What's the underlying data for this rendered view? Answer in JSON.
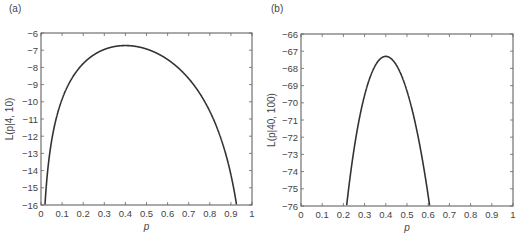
{
  "chart_data": [
    {
      "type": "line",
      "panel_label": "(a)",
      "title": "",
      "xlabel": "p",
      "ylabel": "L(p|4, 10)",
      "xlim": [
        0,
        1
      ],
      "ylim": [
        -16,
        -6
      ],
      "xticks": [
        "0",
        "0.1",
        "0.2",
        "0.3",
        "0.4",
        "0.5",
        "0.6",
        "0.7",
        "0.8",
        "0.9",
        "1"
      ],
      "yticks": [
        "-6",
        "-7",
        "-8",
        "-9",
        "-10",
        "-11",
        "-12",
        "-13",
        "-14",
        "-15",
        "-16"
      ],
      "grid": false,
      "function": "k*ln(p) + (n-k)*ln(1-p)",
      "k": 4,
      "n": 10,
      "series": [
        {
          "name": "L(p|4, 10)",
          "x": [
            0.02,
            0.03,
            0.05,
            0.07,
            0.1,
            0.15,
            0.2,
            0.25,
            0.3,
            0.35,
            0.4,
            0.45,
            0.5,
            0.55,
            0.6,
            0.65,
            0.7,
            0.75,
            0.8,
            0.85,
            0.88,
            0.9,
            0.92,
            0.925
          ],
          "y": [
            -15.77,
            -14.21,
            -12.29,
            -11.07,
            -9.84,
            -8.56,
            -7.78,
            -7.27,
            -6.96,
            -6.79,
            -6.73,
            -6.78,
            -6.93,
            -7.18,
            -7.54,
            -8.02,
            -8.65,
            -9.47,
            -10.55,
            -12.03,
            -13.15,
            -14.24,
            -15.67,
            -16.0
          ]
        }
      ],
      "peak": {
        "x": 0.4,
        "y": -6.73
      }
    },
    {
      "type": "line",
      "panel_label": "(b)",
      "title": "",
      "xlabel": "p",
      "ylabel": "L(p|40, 100)",
      "xlim": [
        0,
        1
      ],
      "ylim": [
        -76,
        -66
      ],
      "xticks": [
        "0",
        "0.1",
        "0.2",
        "0.3",
        "0.4",
        "0.5",
        "0.6",
        "0.7",
        "0.8",
        "0.9",
        "1"
      ],
      "yticks": [
        "-66",
        "-67",
        "-68",
        "-69",
        "-70",
        "-71",
        "-72",
        "-73",
        "-74",
        "-75",
        "-76"
      ],
      "grid": false,
      "function": "k*ln(p) + (n-k)*ln(1-p)",
      "k": 40,
      "n": 100,
      "series": [
        {
          "name": "L(p|40, 100)",
          "x": [
            0.215,
            0.22,
            0.25,
            0.28,
            0.3,
            0.33,
            0.35,
            0.38,
            0.4,
            0.42,
            0.45,
            0.48,
            0.5,
            0.53,
            0.55,
            0.58,
            0.6,
            0.605
          ],
          "y": [
            -76.02,
            -75.59,
            -72.71,
            -70.6,
            -69.56,
            -68.36,
            -67.84,
            -67.39,
            -67.3,
            -67.4,
            -67.82,
            -68.67,
            -69.31,
            -70.55,
            -71.57,
            -73.44,
            -74.98,
            -75.4
          ]
        }
      ],
      "peak": {
        "x": 0.4,
        "y": -67.3
      }
    }
  ],
  "panels": {
    "a": {
      "label": "(a)",
      "xlabel": "p",
      "ylabel": "L(p|4, 10)"
    },
    "b": {
      "label": "(b)",
      "xlabel": "p",
      "ylabel": "L(p|40, 100)"
    }
  },
  "colors": {
    "curve": "#333333",
    "frame": "#555555",
    "text": "#444444"
  }
}
